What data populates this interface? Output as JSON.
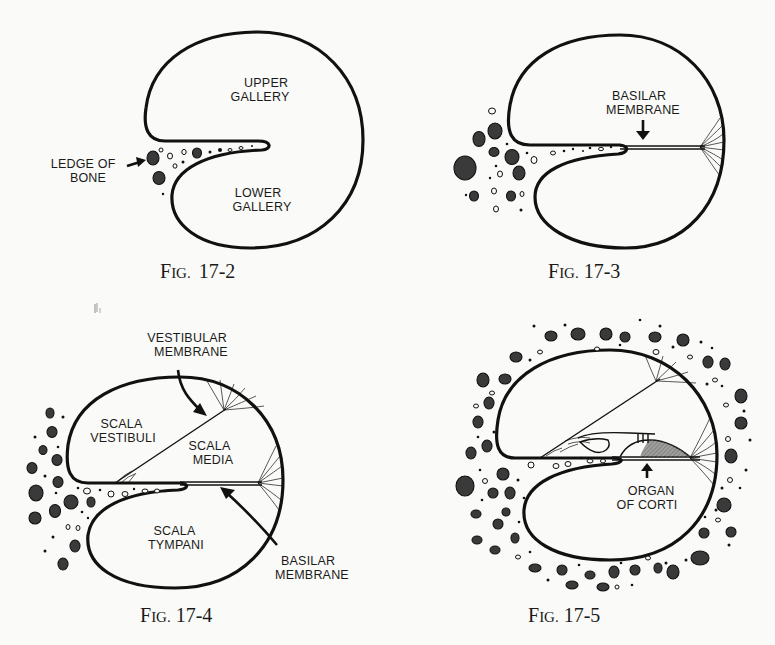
{
  "figures": [
    {
      "id": "fig-17-2",
      "caption": {
        "prefix": "F",
        "smallcaps": "IG.",
        "number": "17-2"
      },
      "labels": {
        "upper_gallery": [
          "UPPER",
          "GALLERY"
        ],
        "lower_gallery": [
          "LOWER",
          "GALLERY"
        ],
        "ledge_of_bone": [
          "LEDGE OF",
          "BONE"
        ]
      }
    },
    {
      "id": "fig-17-3",
      "caption": {
        "prefix": "F",
        "smallcaps": "IG.",
        "number": "17-3"
      },
      "labels": {
        "basilar_membrane": [
          "BASILAR",
          "MEMBRANE"
        ]
      }
    },
    {
      "id": "fig-17-4",
      "caption": {
        "prefix": "F",
        "smallcaps": "IG.",
        "number": "17-4"
      },
      "labels": {
        "vestibular_membrane": [
          "VESTIBULAR",
          "MEMBRANE"
        ],
        "scala_vestibuli": [
          "SCALA",
          "VESTIBULI"
        ],
        "scala_media": [
          "SCALA",
          "MEDIA"
        ],
        "scala_tympani": [
          "SCALA",
          "TYMPANI"
        ],
        "basilar_membrane": [
          "BASILAR",
          "MEMBRANE"
        ]
      }
    },
    {
      "id": "fig-17-5",
      "caption": {
        "prefix": "F",
        "smallcaps": "IG.",
        "number": "17-5"
      },
      "labels": {
        "organ_of_corti": [
          "ORGAN",
          "OF CORTI"
        ]
      }
    }
  ],
  "colors": {
    "ink": "#111111",
    "paper": "#fafaf8"
  }
}
